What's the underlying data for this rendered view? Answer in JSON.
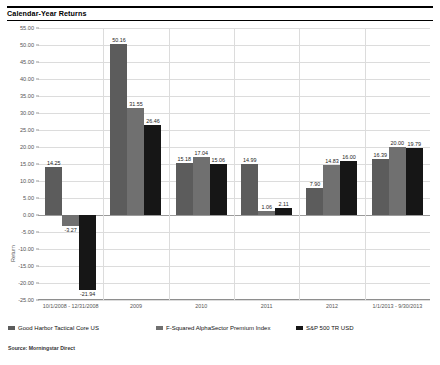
{
  "header": {
    "title": "Calendar-Year Returns"
  },
  "source": {
    "note": "Source: Morningstar Direct"
  },
  "colors": {
    "series1": "#5c5c5c",
    "series2": "#707070",
    "series3": "#161616",
    "gridline": "#dcdcdc",
    "axis_text": "#555555"
  },
  "chart_data": {
    "type": "bar",
    "title": "Calendar-Year Returns",
    "xlabel": "",
    "ylabel": "Return",
    "ylim": [
      -25.0,
      55.0
    ],
    "ytick_step": 5.0,
    "ytick_labels": [
      "55.00",
      "50.00",
      "45.00",
      "40.00",
      "35.00",
      "30.00",
      "25.00",
      "20.00",
      "15.00",
      "10.00",
      "5.00",
      "0.00",
      "-5.00",
      "-10.00",
      "-15.00",
      "-20.00",
      "-25.00"
    ],
    "grid": true,
    "legend_position": "bottom",
    "categories": [
      "10/1/2008 - 12/31/2008",
      "2009",
      "2010",
      "2011",
      "2012",
      "1/1/2013 - 9/30/2013"
    ],
    "series": [
      {
        "name": "Good Harbor Tactical Core US",
        "color": "#5c5c5c",
        "values": [
          14.25,
          50.16,
          15.18,
          14.99,
          7.9,
          16.39
        ],
        "labels": [
          "14.25",
          "50.16",
          "15.18",
          "14.99",
          "7.90",
          "16.39"
        ]
      },
      {
        "name": "F-Squared AlphaSector Premium Index",
        "color": "#707070",
        "values": [
          -3.27,
          31.55,
          17.04,
          1.06,
          14.83,
          20.0
        ],
        "labels": [
          "-3.27",
          "31.55",
          "17.04",
          "1.06",
          "14.83",
          "20.00"
        ]
      },
      {
        "name": "S&P 500 TR USD",
        "color": "#161616",
        "values": [
          -21.94,
          26.46,
          15.06,
          2.11,
          16.0,
          19.79
        ],
        "labels": [
          "-21.94",
          "26.46",
          "15.06",
          "2.11",
          "16.00",
          "19.79"
        ]
      }
    ]
  }
}
